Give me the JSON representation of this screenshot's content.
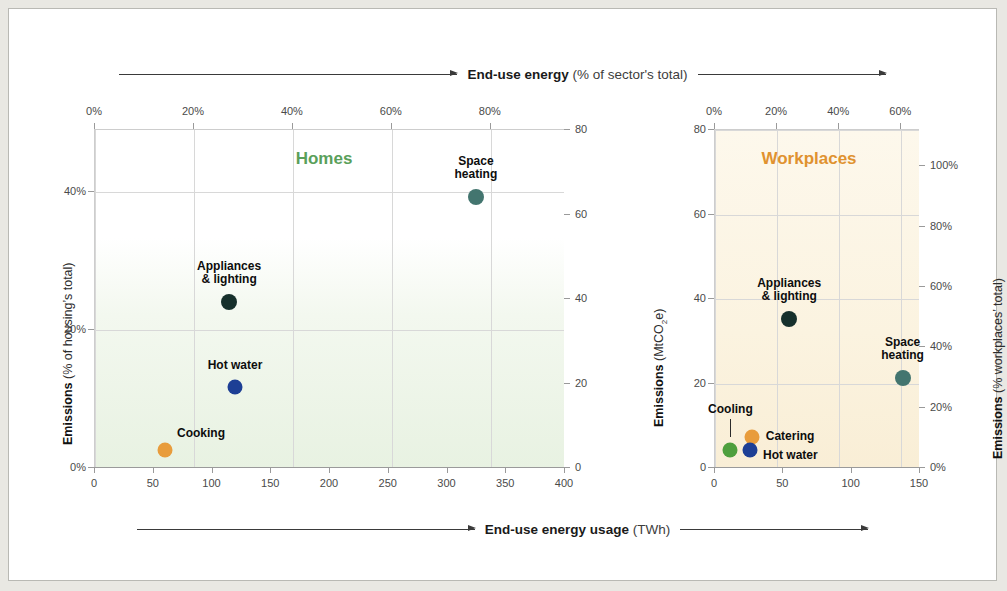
{
  "banners": {
    "top": {
      "bold": "End-use energy",
      "rest": "(% of sector's total)"
    },
    "bottom": {
      "bold": "End-use energy usage",
      "rest": "(TWh)"
    }
  },
  "chart_data": [
    {
      "type": "scatter",
      "title": "Homes",
      "title_color": "#5aa05a",
      "xlabel": "End-use energy usage (TWh)",
      "ylabel": "Emissions (% of housing's total)",
      "y2label": "Emissions (MtCO2e)",
      "xlim": [
        0,
        400
      ],
      "ylim": [
        0,
        80
      ],
      "x_ticks": [
        "0",
        "50",
        "100",
        "150",
        "200",
        "250",
        "300",
        "350",
        "400"
      ],
      "x_tick_values": [
        0,
        50,
        100,
        150,
        200,
        250,
        300,
        350,
        400
      ],
      "x_top_ticks": [
        "0%",
        "20%",
        "40%",
        "60%",
        "80%"
      ],
      "x_top_tick_values": [
        0,
        20,
        40,
        60,
        80
      ],
      "x_top_lim": [
        0,
        95
      ],
      "y_left_ticks": [
        "0%",
        "20%",
        "40%"
      ],
      "y_left_tick_values": [
        0,
        20,
        40
      ],
      "y_left_lim": [
        0,
        49
      ],
      "y_right_ticks": [
        "0",
        "20",
        "40",
        "60",
        "80"
      ],
      "y_right_tick_values": [
        0,
        20,
        40,
        60,
        80
      ],
      "grid": true,
      "points": [
        {
          "label": "Space heating",
          "x": 325,
          "y": 64,
          "color": "#43756f",
          "r": 8,
          "label_lines": [
            "Space",
            "heating"
          ],
          "label_pos": "top"
        },
        {
          "label": "Appliances & lighting",
          "x": 115,
          "y": 39,
          "color": "#16302c",
          "r": 8,
          "label_lines": [
            "Appliances",
            "& lighting"
          ],
          "label_pos": "top"
        },
        {
          "label": "Hot water",
          "x": 120,
          "y": 19,
          "color": "#1d3f95",
          "r": 7.5,
          "label_lines": [
            "Hot water"
          ],
          "label_pos": "top"
        },
        {
          "label": "Cooking",
          "x": 60,
          "y": 4,
          "color": "#e89c3c",
          "r": 7.5,
          "label_lines": [
            "Cooking"
          ],
          "label_pos": "top-right"
        }
      ]
    },
    {
      "type": "scatter",
      "title": "Workplaces",
      "title_color": "#e0922f",
      "xlabel": "End-use energy usage (TWh)",
      "ylabel": "Emissions (MtCO2e)",
      "y2label": "Emissions (% workplaces' total)",
      "xlim": [
        0,
        150
      ],
      "ylim": [
        0,
        80
      ],
      "x_ticks": [
        "0",
        "50",
        "100",
        "150"
      ],
      "x_tick_values": [
        0,
        50,
        100,
        150
      ],
      "x_top_ticks": [
        "0%",
        "20%",
        "40%",
        "60%"
      ],
      "x_top_tick_values": [
        0,
        20,
        40,
        60
      ],
      "x_top_lim": [
        0,
        66
      ],
      "y_left_ticks": [
        "0",
        "20",
        "40",
        "60",
        "80"
      ],
      "y_left_tick_values": [
        0,
        20,
        40,
        60,
        80
      ],
      "y_right_ticks": [
        "0%",
        "20%",
        "40%",
        "60%",
        "80%",
        "100%"
      ],
      "y_right_tick_values": [
        0,
        20,
        40,
        60,
        80,
        100
      ],
      "y_right_lim": [
        0,
        112
      ],
      "grid": true,
      "points": [
        {
          "label": "Appliances & lighting",
          "x": 55,
          "y": 35,
          "color": "#16302c",
          "r": 8,
          "label_lines": [
            "Appliances",
            "& lighting"
          ],
          "label_pos": "top"
        },
        {
          "label": "Space heating",
          "x": 138,
          "y": 21,
          "color": "#43756f",
          "r": 8,
          "label_lines": [
            "Space",
            "heating"
          ],
          "label_pos": "top"
        },
        {
          "label": "Catering",
          "x": 28,
          "y": 7,
          "color": "#e89c3c",
          "r": 7.5,
          "label_lines": [
            "Catering"
          ],
          "label_pos": "right"
        },
        {
          "label": "Hot water",
          "x": 26,
          "y": 4,
          "color": "#1d3f95",
          "r": 7.5,
          "label_lines": [
            "Hot water"
          ],
          "label_pos": "right-low"
        },
        {
          "label": "Cooling",
          "x": 12,
          "y": 4,
          "color": "#4e9f3d",
          "r": 7.5,
          "label_lines": [
            "Cooling"
          ],
          "label_pos": "leader"
        }
      ]
    }
  ]
}
